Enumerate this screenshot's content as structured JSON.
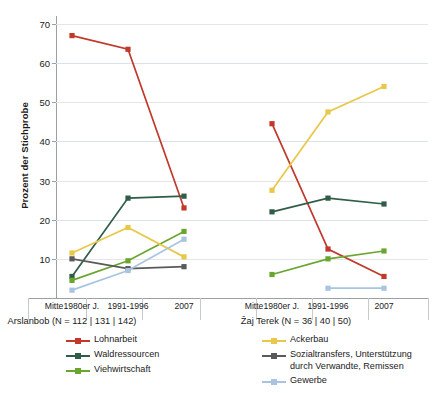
{
  "chart_data": {
    "type": "line",
    "title": "",
    "xlabel": "",
    "ylabel": "Prozent der Stichprobe",
    "ylim": [
      0,
      72
    ],
    "yticks": [
      10,
      20,
      30,
      40,
      50,
      60,
      70
    ],
    "grid": true,
    "legend_position": "bottom",
    "categories": [
      "Mitte1980er J.",
      "1991-1996",
      "2007"
    ],
    "panels": [
      {
        "name": "Arslanbob",
        "caption": "Arslanbob (N = 112 | 131 | 142)",
        "xticks": [
          "Mitte1980er J.",
          "1991-1996",
          "2007"
        ],
        "series": [
          {
            "name": "Lohnarbeit",
            "color": "#c0392b",
            "values": [
              67,
              63.5,
              23
            ]
          },
          {
            "name": "Waldressourcen",
            "color": "#2f5d46",
            "values": [
              5.5,
              25.5,
              26
            ]
          },
          {
            "name": "Viehwirtschaft",
            "color": "#6aa62f",
            "values": [
              4.5,
              9.5,
              17
            ]
          },
          {
            "name": "Ackerbau",
            "color": "#e8c84a",
            "values": [
              11.5,
              18,
              10.5
            ]
          },
          {
            "name": "Sozialtransfers, Unterstützung durch Verwandte, Remissen",
            "color": "#5a5a5a",
            "values": [
              10,
              7.5,
              8
            ]
          },
          {
            "name": "Gewerbe",
            "color": "#a8c4e0",
            "values": [
              2,
              7,
              15
            ]
          }
        ]
      },
      {
        "name": "Zaj Terek",
        "caption": "Žaj Terek (N = 36 | 40 | 50)",
        "xticks": [
          "Mitte1980er J.",
          "1991-1996",
          "2007"
        ],
        "series": [
          {
            "name": "Lohnarbeit",
            "color": "#c0392b",
            "values": [
              44.5,
              12.5,
              5.5
            ]
          },
          {
            "name": "Waldressourcen",
            "color": "#2f5d46",
            "values": [
              22,
              25.5,
              24
            ]
          },
          {
            "name": "Viehwirtschaft",
            "color": "#6aa62f",
            "values": [
              6,
              10,
              12
            ]
          },
          {
            "name": "Ackerbau",
            "color": "#e8c84a",
            "values": [
              27.5,
              47.5,
              54
            ]
          },
          {
            "name": "Sozialtransfers, Unterstützung durch Verwandte, Remissen",
            "color": "#5a5a5a",
            "values": [
              null,
              null,
              null
            ]
          },
          {
            "name": "Gewerbe",
            "color": "#a8c4e0",
            "values": [
              null,
              2.5,
              2.5
            ]
          }
        ]
      }
    ]
  },
  "legends": {
    "left": [
      {
        "label": "Lohnarbeit",
        "color": "#c0392b"
      },
      {
        "label": "Waldressourcen",
        "color": "#2f5d46"
      },
      {
        "label": "Viehwirtschaft",
        "color": "#6aa62f"
      }
    ],
    "right": [
      {
        "label": "Ackerbau",
        "color": "#e8c84a"
      },
      {
        "label": "Sozialtransfers, Unterstützung\ndurch Verwandte, Remissen",
        "color": "#5a5a5a"
      },
      {
        "label": "Gewerbe",
        "color": "#a8c4e0"
      }
    ]
  },
  "axis": {
    "ylabel": "Prozent der Stichprobe",
    "yticks": [
      "70",
      "60",
      "50",
      "40",
      "30",
      "20",
      "10"
    ]
  }
}
